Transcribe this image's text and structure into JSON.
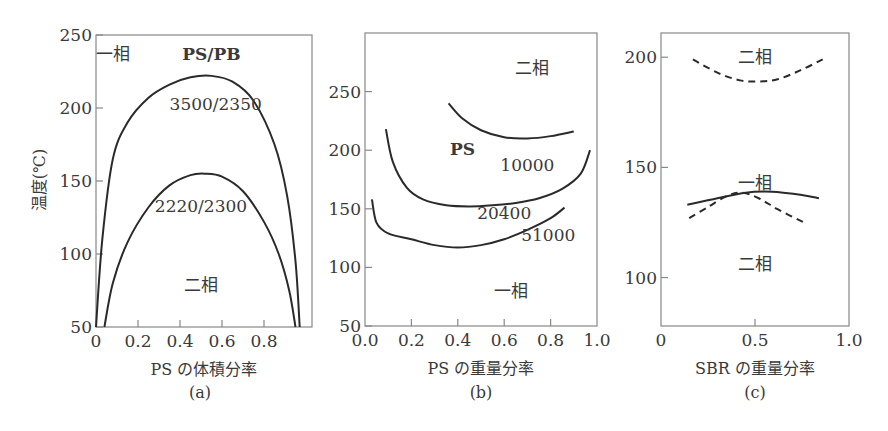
{
  "chart_data": [
    {
      "type": "line",
      "panel_label": "(a)",
      "title": "PS/PB",
      "xlabel": "PS の体積分率",
      "ylabel": "温度(℃)",
      "xlim": [
        0,
        1.0
      ],
      "ylim": [
        50,
        250
      ],
      "xticks": [
        "0",
        "0.2",
        "0.4",
        "0.6",
        "0.8"
      ],
      "xtick_values": [
        0,
        0.2,
        0.4,
        0.6,
        0.8
      ],
      "yticks": [
        "50",
        "100",
        "150",
        "200",
        "250"
      ],
      "ytick_values": [
        50,
        100,
        150,
        200,
        250
      ],
      "grid": false,
      "annotations": [
        {
          "text": "一相",
          "x": 0.08,
          "y": 237
        },
        {
          "text": "PS/PB",
          "x": 0.55,
          "y": 237
        },
        {
          "text": "3500/2350",
          "x": 0.57,
          "y": 203
        },
        {
          "text": "2220/2300",
          "x": 0.5,
          "y": 133
        },
        {
          "text": "二相",
          "x": 0.5,
          "y": 79
        }
      ],
      "series": [
        {
          "name": "3500/2350",
          "style": "solid",
          "x": [
            0.0,
            0.03,
            0.08,
            0.15,
            0.25,
            0.35,
            0.45,
            0.55,
            0.65,
            0.75,
            0.85,
            0.91,
            0.95,
            0.97
          ],
          "y": [
            50,
            110,
            165,
            190,
            207,
            216,
            221,
            222,
            218,
            205,
            175,
            140,
            95,
            50
          ]
        },
        {
          "name": "2220/2300",
          "style": "solid",
          "x": [
            0.04,
            0.08,
            0.15,
            0.25,
            0.35,
            0.45,
            0.52,
            0.6,
            0.7,
            0.8,
            0.87,
            0.92,
            0.95
          ],
          "y": [
            50,
            80,
            108,
            132,
            147,
            154,
            155,
            153,
            143,
            122,
            100,
            75,
            50
          ]
        }
      ]
    },
    {
      "type": "line",
      "panel_label": "(b)",
      "title": "PS",
      "xlabel": "PS の重量分率",
      "ylabel": "",
      "xlim": [
        0,
        1.0
      ],
      "ylim": [
        50,
        300
      ],
      "xticks": [
        "0.0",
        "0.2",
        "0.4",
        "0.6",
        "0.8",
        "1.0"
      ],
      "xtick_values": [
        0,
        0.2,
        0.4,
        0.6,
        0.8,
        1.0
      ],
      "yticks": [
        "50",
        "100",
        "150",
        "200",
        "250"
      ],
      "ytick_values": [
        50,
        100,
        150,
        200,
        250
      ],
      "grid": false,
      "annotations": [
        {
          "text": "二相",
          "x": 0.72,
          "y": 270
        },
        {
          "text": "PS",
          "x": 0.42,
          "y": 201
        },
        {
          "text": "10000",
          "x": 0.7,
          "y": 187
        },
        {
          "text": "20400",
          "x": 0.6,
          "y": 146
        },
        {
          "text": "51000",
          "x": 0.79,
          "y": 128
        },
        {
          "text": "一相",
          "x": 0.63,
          "y": 80
        }
      ],
      "series": [
        {
          "name": "10000",
          "style": "solid",
          "x": [
            0.36,
            0.42,
            0.5,
            0.6,
            0.7,
            0.8,
            0.9
          ],
          "y": [
            240,
            227,
            217,
            211,
            210,
            212,
            216
          ]
        },
        {
          "name": "20400",
          "style": "solid",
          "x": [
            0.09,
            0.12,
            0.18,
            0.25,
            0.35,
            0.45,
            0.55,
            0.65,
            0.75,
            0.85,
            0.93,
            0.97
          ],
          "y": [
            218,
            190,
            168,
            158,
            153,
            152,
            153,
            155,
            159,
            167,
            180,
            200
          ]
        },
        {
          "name": "51000",
          "style": "solid",
          "x": [
            0.03,
            0.05,
            0.1,
            0.2,
            0.3,
            0.4,
            0.5,
            0.6,
            0.7,
            0.8,
            0.86
          ],
          "y": [
            158,
            138,
            129,
            124,
            119,
            117,
            119,
            124,
            132,
            142,
            151
          ]
        }
      ]
    },
    {
      "type": "line",
      "panel_label": "(c)",
      "title": "",
      "xlabel": "SBR の重量分率",
      "ylabel": "",
      "xlim": [
        0,
        1.0
      ],
      "ylim": [
        78,
        211
      ],
      "xticks": [
        "0",
        "0.5",
        "1.0"
      ],
      "xtick_values": [
        0,
        0.5,
        1.0
      ],
      "yticks": [
        "100",
        "150",
        "200"
      ],
      "ytick_values": [
        100,
        150,
        200
      ],
      "grid": false,
      "annotations": [
        {
          "text": "二相",
          "x": 0.5,
          "y": 200
        },
        {
          "text": "一相",
          "x": 0.5,
          "y": 143
        },
        {
          "text": "二相",
          "x": 0.5,
          "y": 106
        }
      ],
      "series": [
        {
          "name": "upper dashed",
          "style": "dashed",
          "x": [
            0.17,
            0.3,
            0.42,
            0.52,
            0.62,
            0.74,
            0.86
          ],
          "y": [
            199,
            193,
            189.5,
            189,
            190,
            194,
            199
          ]
        },
        {
          "name": "lower solid",
          "style": "solid",
          "x": [
            0.14,
            0.3,
            0.45,
            0.55,
            0.65,
            0.75,
            0.84
          ],
          "y": [
            133,
            136,
            138.5,
            139,
            138.5,
            137.5,
            136
          ]
        },
        {
          "name": "lower dashed",
          "style": "dashed",
          "x": [
            0.15,
            0.25,
            0.35,
            0.43,
            0.52,
            0.62,
            0.76
          ],
          "y": [
            127,
            132,
            137,
            138.5,
            136,
            131,
            125
          ]
        }
      ]
    }
  ],
  "labels": {
    "a": {
      "ylabel": "温度(℃)",
      "panel": "(a)"
    },
    "b": {
      "panel": "(b)"
    },
    "c": {
      "panel": "(c)"
    }
  }
}
